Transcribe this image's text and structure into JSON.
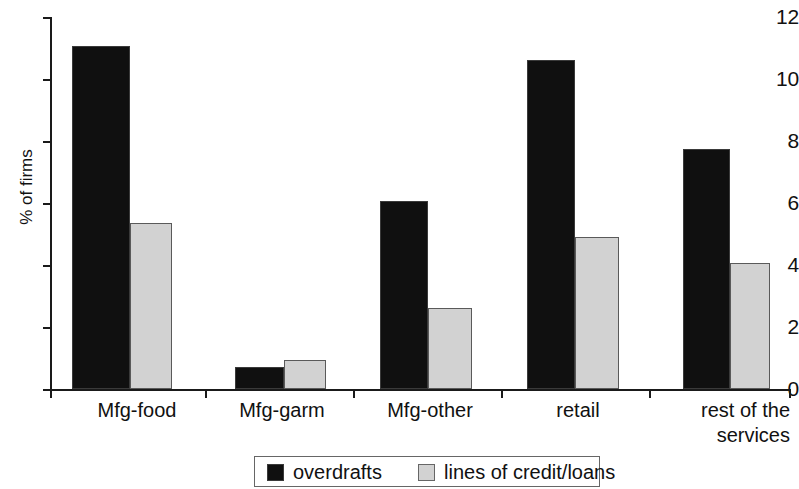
{
  "chart_data": {
    "type": "bar",
    "title": "",
    "xlabel": "",
    "ylabel": "% of firms",
    "ylim": [
      0,
      12
    ],
    "ytick_step": 2,
    "ytick_labels": [
      "12",
      "10",
      "8",
      "6",
      "4",
      "2",
      "0"
    ],
    "grid": false,
    "legend_position": "bottom",
    "categories": [
      "Mfg-food",
      "Mfg-garm",
      "Mfg-other",
      "retail",
      "rest of the\nservices"
    ],
    "series": [
      {
        "name": "overdrafts",
        "color": "#101010",
        "values": [
          11.05,
          0.7,
          6.05,
          10.6,
          7.75
        ]
      },
      {
        "name": "lines of credit/loans",
        "color": "#d2d2d2",
        "values": [
          5.35,
          0.95,
          2.6,
          4.9,
          4.05
        ]
      }
    ]
  },
  "axis": {
    "y_title": "% of firms"
  },
  "legend": {
    "items": [
      {
        "label": "overdrafts",
        "swatch": "dark-square-swatch"
      },
      {
        "label": "lines of credit/loans",
        "swatch": "light-square-swatch"
      }
    ]
  }
}
